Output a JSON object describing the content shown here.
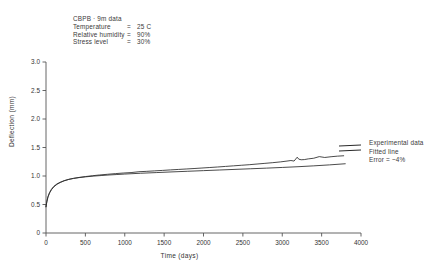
{
  "chart_data": {
    "type": "line",
    "title": "",
    "xlabel": "Time (days)",
    "ylabel": "Deflection (mm)",
    "xlim": [
      0,
      4000
    ],
    "ylim": [
      0,
      3.0
    ],
    "xticks": [
      0,
      500,
      1000,
      1500,
      2000,
      2500,
      3000,
      3500,
      4000
    ],
    "xticklabels": [
      "0",
      "500",
      "1000",
      "1500",
      "2000",
      "2500",
      "3000",
      "3500",
      "4000"
    ],
    "yticks": [
      0,
      0.5,
      1.0,
      1.5,
      2.0,
      2.5,
      3.0
    ],
    "yticklabels": [
      "0",
      "0.5",
      "1.0",
      "1.5",
      "2.0",
      "2.5",
      "3.0"
    ],
    "grid": false,
    "legend_position": "right-outside",
    "series": [
      {
        "name": "Experimental data",
        "color": "#2a2a2a",
        "x": [
          0,
          10,
          25,
          45,
          70,
          100,
          140,
          180,
          230,
          290,
          350,
          420,
          500,
          590,
          680,
          780,
          880,
          980,
          1080,
          1180,
          1280,
          1380,
          1480,
          1580,
          1680,
          1780,
          1880,
          1980,
          2080,
          2180,
          2280,
          2380,
          2480,
          2580,
          2680,
          2780,
          2880,
          2980,
          3060,
          3110,
          3150,
          3190,
          3210,
          3240,
          3280,
          3330,
          3400,
          3470,
          3540,
          3620,
          3700,
          3780
        ],
        "y": [
          0.46,
          0.54,
          0.63,
          0.7,
          0.76,
          0.81,
          0.855,
          0.885,
          0.915,
          0.94,
          0.958,
          0.975,
          0.99,
          1.005,
          1.018,
          1.03,
          1.042,
          1.052,
          1.06,
          1.075,
          1.082,
          1.09,
          1.098,
          1.107,
          1.115,
          1.123,
          1.131,
          1.14,
          1.149,
          1.158,
          1.168,
          1.178,
          1.188,
          1.198,
          1.21,
          1.222,
          1.234,
          1.248,
          1.262,
          1.272,
          1.262,
          1.33,
          1.295,
          1.285,
          1.288,
          1.3,
          1.312,
          1.34,
          1.325,
          1.338,
          1.348,
          1.355
        ]
      },
      {
        "name": "Fitted line",
        "color": "#2a2a2a",
        "x": [
          0,
          10,
          25,
          45,
          70,
          100,
          140,
          180,
          230,
          290,
          350,
          420,
          500,
          600,
          700,
          800,
          900,
          1000,
          1200,
          1400,
          1600,
          1800,
          2000,
          2200,
          2400,
          2600,
          2800,
          3000,
          3200,
          3400,
          3600,
          3800
        ],
        "y": [
          0.46,
          0.55,
          0.64,
          0.71,
          0.77,
          0.82,
          0.862,
          0.89,
          0.918,
          0.942,
          0.958,
          0.972,
          0.985,
          0.998,
          1.008,
          1.018,
          1.026,
          1.034,
          1.048,
          1.06,
          1.072,
          1.083,
          1.094,
          1.105,
          1.116,
          1.127,
          1.138,
          1.15,
          1.163,
          1.178,
          1.195,
          1.215
        ]
      }
    ],
    "annotation": {
      "title": "CBPB · 9m data",
      "rows": [
        {
          "key": "Temperature",
          "eq": "=",
          "value": "25 C"
        },
        {
          "key": "Relative humidity",
          "eq": "=",
          "value": "90%"
        },
        {
          "key": "Stress level",
          "eq": "=",
          "value": "30%"
        }
      ]
    },
    "legend": {
      "entries": [
        "Experimental data",
        "Fitted line"
      ],
      "error_text": "Error = ~4%"
    }
  }
}
